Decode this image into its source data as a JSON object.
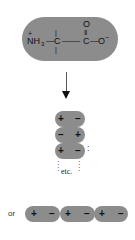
{
  "amino_acid": {
    "charge_plus": "+",
    "amine": "NH",
    "amine_sub": "3",
    "bond1": "—",
    "alpha_carbon": "C",
    "bond2": "——",
    "carbonyl_carbon": "C",
    "carbonyl_oxygen": "O",
    "double_bond": "‖",
    "bond3": "—",
    "carboxyl_oxygen": "O",
    "charge_minus": "−",
    "bond_vertical": "|"
  },
  "arrow": {
    "direction": "down"
  },
  "stack": {
    "rows": [
      {
        "left": "+",
        "right": "−"
      },
      {
        "left": "−",
        "right": "+"
      },
      {
        "left": "+",
        "right": "−"
      }
    ],
    "etc_label": "etc.",
    "continuation": ":"
  },
  "chain": {
    "prefix": "or",
    "units": [
      {
        "left": "+",
        "right": "−"
      },
      {
        "left": "+",
        "right": "−"
      },
      {
        "left": "+",
        "right": "−"
      }
    ]
  },
  "colors": {
    "pill": "#8c8c8c",
    "text": "#111111"
  }
}
